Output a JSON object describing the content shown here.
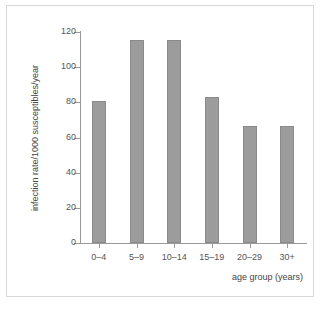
{
  "chart_data": {
    "type": "bar",
    "title": "",
    "categories": [
      "0–4",
      "5–9",
      "10–14",
      "15–19",
      "20–29",
      "30+"
    ],
    "values": [
      81,
      115.5,
      115.5,
      83,
      66.5,
      66.5
    ],
    "xlabel": "age group (years)",
    "ylabel": "infection rate/1000 susceptibles/year",
    "ylim": [
      0,
      120
    ],
    "yticks": [
      0,
      20,
      40,
      60,
      80,
      100,
      120
    ],
    "ytick_labels": [
      "0",
      "20",
      "40",
      "60",
      "80",
      "100",
      "120"
    ],
    "grid": false,
    "legend": null,
    "bar_color": "#9c9c9c",
    "axis_color": "#9a9a9a",
    "frame_color": "#d8d8d8",
    "text_color": "#555555"
  }
}
